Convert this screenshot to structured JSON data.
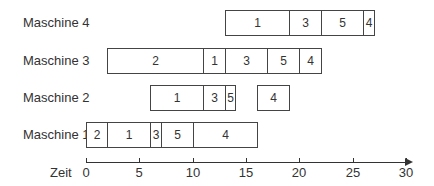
{
  "chart_data": {
    "type": "gantt",
    "title": "",
    "xlabel": "Zeit",
    "xlim": [
      0,
      30
    ],
    "xticks": [
      0,
      5,
      10,
      15,
      20,
      25,
      30
    ],
    "rows": [
      {
        "name": "Maschine 4",
        "tasks": [
          {
            "label": "1",
            "start": 13,
            "end": 19
          },
          {
            "label": "3",
            "start": 19,
            "end": 22
          },
          {
            "label": "5",
            "start": 22,
            "end": 26
          },
          {
            "label": "4",
            "start": 26,
            "end": 27
          }
        ]
      },
      {
        "name": "Maschine 3",
        "tasks": [
          {
            "label": "2",
            "start": 2,
            "end": 11
          },
          {
            "label": "1",
            "start": 11,
            "end": 13
          },
          {
            "label": "3",
            "start": 13,
            "end": 17
          },
          {
            "label": "5",
            "start": 17,
            "end": 20
          },
          {
            "label": "4",
            "start": 20,
            "end": 22
          }
        ]
      },
      {
        "name": "Maschine 2",
        "tasks": [
          {
            "label": "1",
            "start": 6,
            "end": 11
          },
          {
            "label": "3",
            "start": 11,
            "end": 13
          },
          {
            "label": "5",
            "start": 13,
            "end": 14
          },
          {
            "label": "4",
            "start": 16,
            "end": 19
          }
        ]
      },
      {
        "name": "Maschine 1",
        "tasks": [
          {
            "label": "2",
            "start": 0,
            "end": 2
          },
          {
            "label": "1",
            "start": 2,
            "end": 6
          },
          {
            "label": "3",
            "start": 6,
            "end": 7
          },
          {
            "label": "5",
            "start": 7,
            "end": 10
          },
          {
            "label": "4",
            "start": 10,
            "end": 16
          }
        ]
      }
    ]
  }
}
